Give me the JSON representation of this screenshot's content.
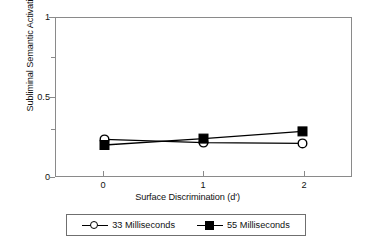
{
  "chart_data": {
    "type": "line",
    "title": "",
    "xlabel": "Surface Discrimination (d')",
    "ylabel": "Subliminal Semantic Activation (d')",
    "x": [
      0,
      1,
      2
    ],
    "xtick_labels": [
      "0",
      "1",
      "2"
    ],
    "ytick_labels": [
      "0",
      "0.5",
      "1"
    ],
    "ytick_values": [
      0,
      0.5,
      1
    ],
    "yminor_values": [
      0.25,
      0.75
    ],
    "xlim": [
      -0.5,
      2.5
    ],
    "ylim": [
      0,
      1
    ],
    "grid": false,
    "legend_position": "below",
    "series": [
      {
        "name": "33 Milliseconds",
        "marker": "open-circle",
        "color": "#000000",
        "values": [
          0.235,
          0.215,
          0.21
        ]
      },
      {
        "name": "55 Milliseconds",
        "marker": "filled-square",
        "color": "#000000",
        "values": [
          0.2,
          0.24,
          0.285
        ]
      }
    ]
  },
  "legend": {
    "entries": [
      {
        "label": "33 Milliseconds",
        "marker": "open-circle-icon"
      },
      {
        "label": "55 Milliseconds",
        "marker": "filled-square-icon"
      }
    ]
  }
}
